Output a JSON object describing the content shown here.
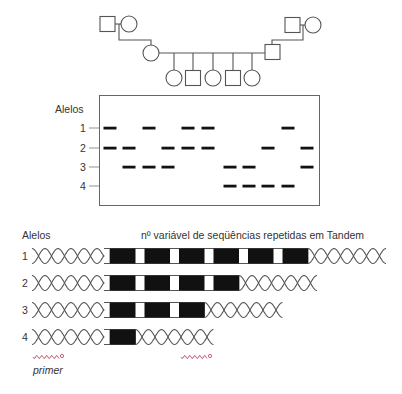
{
  "pedigree": {
    "left_grandparents": [
      {
        "sex": "male"
      },
      {
        "sex": "female"
      }
    ],
    "right_grandparents": [
      {
        "sex": "male"
      },
      {
        "sex": "female"
      }
    ],
    "parents": [
      {
        "sex": "female",
        "side": "left"
      },
      {
        "sex": "male",
        "side": "right"
      }
    ],
    "children": [
      {
        "sex": "female"
      },
      {
        "sex": "male"
      },
      {
        "sex": "female"
      },
      {
        "sex": "male"
      },
      {
        "sex": "female"
      }
    ]
  },
  "gel": {
    "axis_label": "Alelos",
    "allele_labels": [
      "1",
      "2",
      "3",
      "4"
    ],
    "lanes": [
      {
        "alleles": [
          1,
          2
        ]
      },
      {
        "alleles": [
          2,
          3
        ]
      },
      {
        "alleles": [
          1,
          3
        ]
      },
      {
        "alleles": [
          2,
          3
        ]
      },
      {
        "alleles": [
          1,
          2
        ]
      },
      {
        "alleles": [
          1,
          2
        ]
      },
      {
        "alleles": [
          3,
          4
        ]
      },
      {
        "alleles": [
          3,
          4
        ]
      },
      {
        "alleles": [
          2,
          4
        ]
      },
      {
        "alleles": [
          1,
          4
        ]
      },
      {
        "alleles": [
          2,
          3
        ]
      }
    ]
  },
  "repeats": {
    "axis_label": "Alelos",
    "title": "nº variável de seqüências repetidas em Tandem",
    "alleles": [
      {
        "label": "1",
        "repeat_count": 6
      },
      {
        "label": "2",
        "repeat_count": 4
      },
      {
        "label": "3",
        "repeat_count": 3
      },
      {
        "label": "4",
        "repeat_count": 1
      }
    ],
    "primer_label": "primer",
    "primer_color": "#c0506a"
  }
}
